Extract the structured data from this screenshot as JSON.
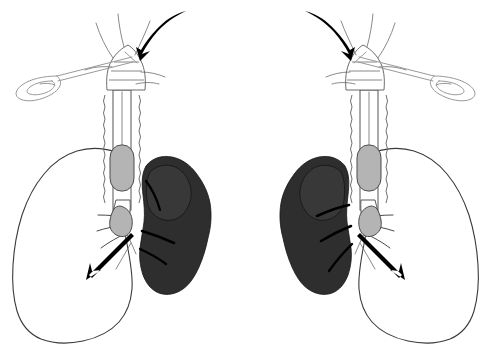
{
  "figure": {
    "subtitle": "Two mirrored panels: left-lung ventilation and right-lung ventilation",
    "background_color": "#ffffff",
    "panel_count": 2
  },
  "palette": {
    "page_background": "#ffffff",
    "collapsed_lung_fill": "#2e2e2e",
    "collapsed_lung_stroke": "#141414",
    "aerated_lung_fill": "#ffffff",
    "outline_stroke": "#3a3a3a",
    "cuff_fill": "#b4b4b4",
    "cuff_stroke": "#4d4d4d",
    "tube_fill": "#ffffff",
    "tube_stroke": "#555555",
    "instrument_stroke": "#9a9a9a",
    "arrow_fill": "#000000",
    "airway_stroke": "#4a4a4a"
  },
  "panels": [
    {
      "id": "panel-left",
      "name": "left-lung-ventilated",
      "aerated_lung_side": "left",
      "collapsed_lung_side": "right",
      "mirrored": false,
      "instrument_side": "left",
      "airflow_arrow_direction": "down-left",
      "insertion_arrow_direction": "down-left"
    },
    {
      "id": "panel-right",
      "name": "right-lung-ventilated",
      "aerated_lung_side": "right",
      "collapsed_lung_side": "left",
      "mirrored": true,
      "instrument_side": "right",
      "airflow_arrow_direction": "down-right",
      "insertion_arrow_direction": "down-right"
    }
  ],
  "anatomy": {
    "aerated_lung": {
      "label": "Ventilated (aerated) lung",
      "render": "white outline"
    },
    "collapsed_lung": {
      "label": "Collapsed (atelectatic) lung",
      "render": "dark solid fill"
    },
    "trachea": {
      "label": "Trachea with cartilage rings",
      "render": "scalloped double wall"
    },
    "larynx": {
      "label": "Larynx and vocal cords",
      "render": "funnel with cricoid rings"
    },
    "carina": {
      "label": "Carina / main bronchial bifurcation"
    },
    "bronchi": {
      "label": "Segmental bronchi",
      "collapsed_side_branch_count": 3,
      "aerated_side_branch_count": 4
    }
  },
  "device": {
    "name": "double-lumen-endobronchial-tube",
    "tracheal_cuff": {
      "label": "Tracheal cuff",
      "state": "inflated",
      "fill": "#b4b4b4"
    },
    "bronchial_cuff": {
      "label": "Bronchial cuff",
      "state": "inflated",
      "fill": "#b4b4b4"
    },
    "lumen_count": 2
  },
  "instrument": {
    "name": "laryngoscope-handle",
    "label": "Laryngoscope / stylet handle",
    "render": "thin gray outline with loop grip"
  },
  "arrows": {
    "insertion": {
      "name": "insertion-arrow",
      "label": "Tube insertion direction into larynx",
      "style": "curved solid black"
    },
    "airflow": {
      "name": "airflow-arrow",
      "label": "Ventilation gas flow into aerated lung",
      "style": "straight solid black"
    }
  }
}
